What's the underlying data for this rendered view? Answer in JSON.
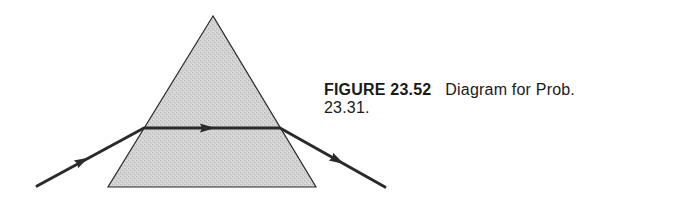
{
  "figure": {
    "label": "FIGURE 23.52",
    "caption_line1": "Diagram for Prob.",
    "caption_line2": "23.31."
  },
  "diagram": {
    "type": "prism-refraction",
    "prism": {
      "shape": "equilateral-triangle",
      "apex": [
        213,
        16
      ],
      "bottom_left": [
        108,
        187
      ],
      "bottom_right": [
        316,
        187
      ],
      "fill": "#cfcfcf",
      "stroke": "#2a2a2a"
    },
    "ray": {
      "color": "#2a2a2a",
      "points": [
        [
          37,
          186
        ],
        [
          144,
          128
        ],
        [
          280,
          128
        ],
        [
          385,
          187
        ]
      ],
      "arrows": [
        {
          "segment": "incident",
          "at": [
            82,
            161
          ]
        },
        {
          "segment": "internal",
          "at": [
            209,
            128
          ]
        },
        {
          "segment": "emergent",
          "at": [
            337,
            161
          ]
        }
      ]
    }
  }
}
